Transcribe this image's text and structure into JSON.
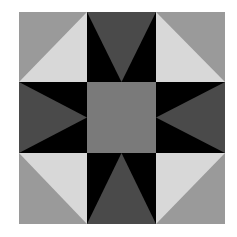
{
  "quilt_block": {
    "grid": {
      "rows": 3,
      "cols": 3
    },
    "colors": {
      "background": "#ffffff",
      "corner_outer": "#9a9a9a",
      "corner_inner": "#d8d8d8",
      "side_background": "#000000",
      "side_triangle": "#4a4a4a",
      "center": "#7a7a7a"
    },
    "cells": [
      {
        "position": "top-left",
        "type": "half-square-triangle",
        "light_toward": "center"
      },
      {
        "position": "top-center",
        "type": "flying-triangle",
        "points": "down"
      },
      {
        "position": "top-right",
        "type": "half-square-triangle",
        "light_toward": "center"
      },
      {
        "position": "middle-left",
        "type": "flying-triangle",
        "points": "right"
      },
      {
        "position": "center",
        "type": "solid-square"
      },
      {
        "position": "middle-right",
        "type": "flying-triangle",
        "points": "left"
      },
      {
        "position": "bottom-left",
        "type": "half-square-triangle",
        "light_toward": "center"
      },
      {
        "position": "bottom-center",
        "type": "flying-triangle",
        "points": "up"
      },
      {
        "position": "bottom-right",
        "type": "half-square-triangle",
        "light_toward": "center"
      }
    ]
  }
}
